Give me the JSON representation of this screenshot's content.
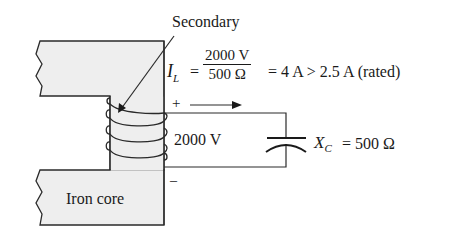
{
  "diagram": {
    "type": "transformer-secondary-circuit",
    "labels": {
      "secondary": "Secondary",
      "iron_core": "Iron core",
      "voltage": "2000 V",
      "plus": "+",
      "minus": "–",
      "current_symbol": "I",
      "current_subscript": "L",
      "equals": "=",
      "numerator": "2000 V",
      "denominator": "500 Ω",
      "result": "= 4 A > 2.5 A (rated)",
      "cap_symbol": "X",
      "cap_subscript": "C",
      "cap_value": "= 500 Ω"
    },
    "colors": {
      "line": "#2a2a2a",
      "core_fill": "#eeeeee",
      "background": "#ffffff"
    },
    "coil_turns": 4
  }
}
